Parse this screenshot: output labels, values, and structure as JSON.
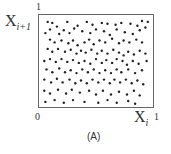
{
  "figure": {
    "caption": "(A)",
    "y_axis_label": "X",
    "y_axis_sub": "i+1",
    "x_axis_label": "X",
    "x_axis_sub": "i",
    "y_top_tick": "1",
    "x_origin_tick": "0",
    "x_right_tick": "1"
  },
  "chart_data": {
    "type": "scatter",
    "title": "(A)",
    "xlabel": "X_i",
    "ylabel": "X_{i+1}",
    "xlim": [
      0,
      1
    ],
    "ylim": [
      0,
      1
    ],
    "grid": false,
    "legend": "none",
    "points": [
      [
        0.08,
        0.92
      ],
      [
        0.12,
        0.91
      ],
      [
        0.16,
        0.87
      ],
      [
        0.25,
        0.92
      ],
      [
        0.34,
        0.88
      ],
      [
        0.42,
        0.92
      ],
      [
        0.47,
        0.89
      ],
      [
        0.55,
        0.91
      ],
      [
        0.6,
        0.9
      ],
      [
        0.67,
        0.89
      ],
      [
        0.72,
        0.91
      ],
      [
        0.8,
        0.9
      ],
      [
        0.86,
        0.88
      ],
      [
        0.9,
        0.93
      ],
      [
        0.95,
        0.92
      ],
      [
        0.06,
        0.8
      ],
      [
        0.1,
        0.84
      ],
      [
        0.18,
        0.79
      ],
      [
        0.22,
        0.83
      ],
      [
        0.27,
        0.8
      ],
      [
        0.31,
        0.85
      ],
      [
        0.38,
        0.82
      ],
      [
        0.45,
        0.8
      ],
      [
        0.5,
        0.84
      ],
      [
        0.57,
        0.82
      ],
      [
        0.62,
        0.78
      ],
      [
        0.68,
        0.84
      ],
      [
        0.75,
        0.81
      ],
      [
        0.82,
        0.79
      ],
      [
        0.88,
        0.83
      ],
      [
        0.93,
        0.86
      ],
      [
        0.1,
        0.73
      ],
      [
        0.14,
        0.7
      ],
      [
        0.2,
        0.72
      ],
      [
        0.26,
        0.69
      ],
      [
        0.3,
        0.72
      ],
      [
        0.34,
        0.67
      ],
      [
        0.4,
        0.7
      ],
      [
        0.44,
        0.73
      ],
      [
        0.48,
        0.68
      ],
      [
        0.53,
        0.72
      ],
      [
        0.58,
        0.7
      ],
      [
        0.64,
        0.74
      ],
      [
        0.7,
        0.69
      ],
      [
        0.74,
        0.72
      ],
      [
        0.79,
        0.7
      ],
      [
        0.85,
        0.73
      ],
      [
        0.9,
        0.7
      ],
      [
        0.08,
        0.63
      ],
      [
        0.12,
        0.6
      ],
      [
        0.17,
        0.63
      ],
      [
        0.23,
        0.6
      ],
      [
        0.28,
        0.62
      ],
      [
        0.33,
        0.58
      ],
      [
        0.37,
        0.61
      ],
      [
        0.41,
        0.59
      ],
      [
        0.46,
        0.62
      ],
      [
        0.51,
        0.58
      ],
      [
        0.55,
        0.61
      ],
      [
        0.6,
        0.58
      ],
      [
        0.65,
        0.62
      ],
      [
        0.7,
        0.59
      ],
      [
        0.74,
        0.56
      ],
      [
        0.78,
        0.6
      ],
      [
        0.83,
        0.57
      ],
      [
        0.88,
        0.61
      ],
      [
        0.93,
        0.58
      ],
      [
        0.05,
        0.5
      ],
      [
        0.1,
        0.52
      ],
      [
        0.15,
        0.49
      ],
      [
        0.2,
        0.52
      ],
      [
        0.25,
        0.49
      ],
      [
        0.3,
        0.51
      ],
      [
        0.35,
        0.48
      ],
      [
        0.4,
        0.5
      ],
      [
        0.45,
        0.47
      ],
      [
        0.5,
        0.52
      ],
      [
        0.55,
        0.48
      ],
      [
        0.59,
        0.51
      ],
      [
        0.64,
        0.48
      ],
      [
        0.68,
        0.52
      ],
      [
        0.73,
        0.5
      ],
      [
        0.77,
        0.46
      ],
      [
        0.82,
        0.5
      ],
      [
        0.87,
        0.47
      ],
      [
        0.94,
        0.5
      ],
      [
        0.07,
        0.41
      ],
      [
        0.12,
        0.38
      ],
      [
        0.18,
        0.42
      ],
      [
        0.23,
        0.38
      ],
      [
        0.28,
        0.4
      ],
      [
        0.33,
        0.37
      ],
      [
        0.38,
        0.41
      ],
      [
        0.43,
        0.38
      ],
      [
        0.48,
        0.41
      ],
      [
        0.53,
        0.37
      ],
      [
        0.58,
        0.4
      ],
      [
        0.63,
        0.37
      ],
      [
        0.68,
        0.41
      ],
      [
        0.72,
        0.38
      ],
      [
        0.78,
        0.41
      ],
      [
        0.84,
        0.37
      ],
      [
        0.9,
        0.4
      ],
      [
        0.05,
        0.3
      ],
      [
        0.11,
        0.27
      ],
      [
        0.16,
        0.31
      ],
      [
        0.21,
        0.27
      ],
      [
        0.27,
        0.3
      ],
      [
        0.32,
        0.26
      ],
      [
        0.37,
        0.29
      ],
      [
        0.42,
        0.26
      ],
      [
        0.47,
        0.3
      ],
      [
        0.52,
        0.27
      ],
      [
        0.57,
        0.3
      ],
      [
        0.62,
        0.26
      ],
      [
        0.66,
        0.3
      ],
      [
        0.71,
        0.27
      ],
      [
        0.76,
        0.3
      ],
      [
        0.81,
        0.26
      ],
      [
        0.86,
        0.29
      ],
      [
        0.91,
        0.25
      ],
      [
        0.05,
        0.18
      ],
      [
        0.1,
        0.15
      ],
      [
        0.17,
        0.19
      ],
      [
        0.24,
        0.15
      ],
      [
        0.29,
        0.19
      ],
      [
        0.36,
        0.16
      ],
      [
        0.44,
        0.18
      ],
      [
        0.5,
        0.14
      ],
      [
        0.56,
        0.18
      ],
      [
        0.63,
        0.14
      ],
      [
        0.7,
        0.17
      ],
      [
        0.77,
        0.14
      ],
      [
        0.83,
        0.18
      ],
      [
        0.88,
        0.13
      ],
      [
        0.06,
        0.06
      ],
      [
        0.14,
        0.08
      ],
      [
        0.22,
        0.05
      ],
      [
        0.3,
        0.08
      ],
      [
        0.4,
        0.06
      ],
      [
        0.52,
        0.05
      ],
      [
        0.6,
        0.08
      ],
      [
        0.68,
        0.05
      ],
      [
        0.78,
        0.07
      ],
      [
        0.84,
        0.04
      ]
    ]
  }
}
